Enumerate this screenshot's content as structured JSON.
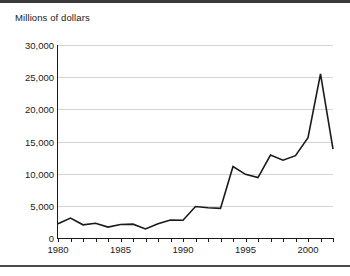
{
  "figure": {
    "axis_title": "Millions of dollars",
    "line_color": "#1a1a1a",
    "grid_color": "#d4d4d4",
    "axis_color": "#1a1a1a",
    "background": "#ffffff"
  },
  "chart_data": {
    "type": "line",
    "title": "",
    "subtitle": "",
    "xlabel": "",
    "ylabel": "Millions of dollars",
    "ylim": [
      0,
      30000
    ],
    "xlim": [
      1980,
      2002
    ],
    "grid": true,
    "legend": "none",
    "ytick_labels": [
      "30,000",
      "25,000",
      "20,000",
      "15,000",
      "10,000",
      "5,000",
      "0"
    ],
    "ytick_values": [
      30000,
      25000,
      20000,
      15000,
      10000,
      5000,
      0
    ],
    "xtick_labels": [
      "1980",
      "1985",
      "1990",
      "1995",
      "2000"
    ],
    "xtick_values": [
      1980,
      1985,
      1990,
      1995,
      2000
    ],
    "x": [
      1980,
      1981,
      1982,
      1983,
      1984,
      1985,
      1986,
      1987,
      1988,
      1989,
      1990,
      1991,
      1992,
      1993,
      1994,
      1995,
      1996,
      1997,
      1998,
      1999,
      2000,
      2001,
      2002
    ],
    "values": [
      2200,
      3100,
      2050,
      2300,
      1700,
      2100,
      2150,
      1400,
      2200,
      2800,
      2750,
      4900,
      4700,
      4600,
      11100,
      9900,
      9400,
      12900,
      12100,
      12800,
      15600,
      25500,
      13800
    ],
    "series": [
      {
        "name": "Millions of dollars",
        "values": [
          2200,
          3100,
          2050,
          2300,
          1700,
          2100,
          2150,
          1400,
          2200,
          2800,
          2750,
          4900,
          4700,
          4600,
          11100,
          9900,
          9400,
          12900,
          12100,
          12800,
          15600,
          25500,
          13800
        ]
      }
    ]
  }
}
